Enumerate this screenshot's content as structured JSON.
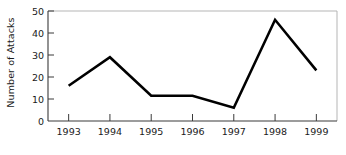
{
  "chart_data": {
    "type": "line",
    "title": "",
    "subtitle": "",
    "xlabel": "",
    "ylabel": "Number of Attacks",
    "categories": [
      "1993",
      "1994",
      "1995",
      "1996",
      "1997",
      "1998",
      "1999"
    ],
    "x": [
      1993,
      1994,
      1995,
      1996,
      1997,
      1998,
      1999
    ],
    "values": [
      16,
      29,
      11.5,
      11.5,
      6,
      46,
      23
    ],
    "series": [
      {
        "name": "Number of Attacks",
        "values": [
          16,
          29,
          11.5,
          11.5,
          6,
          46,
          23
        ]
      }
    ],
    "ylim": [
      0,
      50
    ],
    "yticks": [
      0,
      10,
      20,
      30,
      40,
      50
    ],
    "ytick_labels": [
      "0",
      "10",
      "20",
      "30",
      "40",
      "50"
    ],
    "xtick_labels": [
      "1993",
      "1994",
      "1995",
      "1996",
      "1997",
      "1998",
      "1999"
    ],
    "grid": false,
    "legend": false,
    "legend_position": "none",
    "markers": false,
    "line_color": "#000000",
    "line_width": 2.6,
    "axis_color": "#3a3a3a",
    "frame_color": "#b5b5b5",
    "background_color": "#ffffff",
    "text_color": "#1a1a1a",
    "annotations": []
  },
  "layout": {
    "plot_left": 48,
    "plot_right": 337,
    "plot_top": 11,
    "plot_bottom": 121
  }
}
